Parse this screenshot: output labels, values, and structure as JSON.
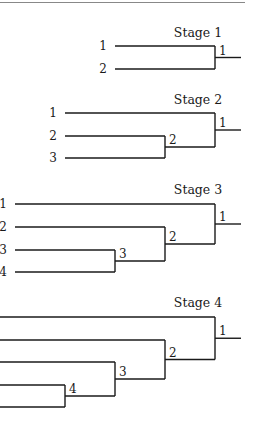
{
  "stages": [
    {
      "title": "Stage 1",
      "teams": [
        "1",
        "2"
      ],
      "match_labels": [
        "1"
      ]
    },
    {
      "title": "Stage 2",
      "teams": [
        "1",
        "2",
        "3"
      ],
      "match_labels": [
        "1",
        "2"
      ]
    },
    {
      "title": "Stage 3",
      "teams": [
        "1",
        "2",
        "3",
        "4"
      ],
      "match_labels": [
        "1",
        "2",
        "3"
      ]
    },
    {
      "title": "Stage 4",
      "teams": [
        "1",
        "2",
        "3",
        "4",
        "5"
      ],
      "match_labels": [
        "1",
        "2",
        "3",
        "4"
      ]
    }
  ]
}
